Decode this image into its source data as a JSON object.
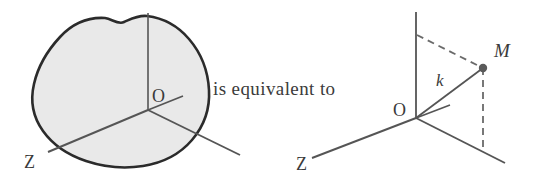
{
  "figure": {
    "caption_text": "is equivalent to",
    "colors": {
      "blob_fill": "#e9e9e9",
      "blob_outline": "#2b2b2b",
      "axis_line": "#555555",
      "dashed_line": "#6a6a6a",
      "label_text": "#3a3a3a",
      "point_marker": "#5a5a5a",
      "background": "#ffffff"
    },
    "left_diagram": {
      "name": "solid-body-with-axes",
      "labels": {
        "origin": "O",
        "z_axis": "Z"
      },
      "description": "irregular shaded solid body with a three-axis coordinate frame at point O"
    },
    "right_diagram": {
      "name": "axes-with-point-M",
      "labels": {
        "origin": "O",
        "z_axis": "Z",
        "point": "M",
        "vector": "k"
      },
      "description": "three-axis coordinate frame at point O with point M connected by segment k and dashed projection lines"
    }
  }
}
